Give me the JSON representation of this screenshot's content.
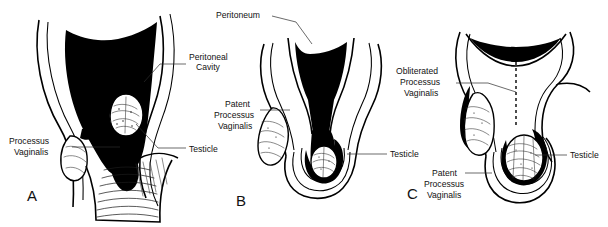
{
  "figure": {
    "background_color": "#ffffff",
    "ink_color": "#000000",
    "label_color": "#111111",
    "width": 608,
    "height": 227
  },
  "panels": [
    {
      "letter": "A",
      "labels": [
        {
          "id": "peritoneal-cavity",
          "text_lines": [
            "Peritoneal",
            "Cavity"
          ]
        },
        {
          "id": "processus-vaginalis",
          "text_lines": [
            "Processus",
            "Vaginalis"
          ]
        },
        {
          "id": "testicle",
          "text_lines": [
            "Testicle"
          ]
        }
      ]
    },
    {
      "letter": "B",
      "labels": [
        {
          "id": "peritoneum",
          "text_lines": [
            "Peritoneum"
          ]
        },
        {
          "id": "patent-processus-vaginalis",
          "text_lines": [
            "Patent",
            "Processus",
            "Vaginalis"
          ]
        },
        {
          "id": "testicle",
          "text_lines": [
            "Testicle"
          ]
        }
      ]
    },
    {
      "letter": "C",
      "labels": [
        {
          "id": "obliterated-processus-vaginalis",
          "text_lines": [
            "Obliterated",
            "Processus",
            "Vaginalis"
          ]
        },
        {
          "id": "testicle",
          "text_lines": [
            "Testicle"
          ]
        },
        {
          "id": "patent-processus-vaginalis",
          "text_lines": [
            "Patent",
            "Processus",
            "Vaginalis"
          ]
        }
      ]
    }
  ],
  "text": {
    "panel_a": {
      "letter": "A",
      "peritoneal_cavity_1": "Peritoneal",
      "peritoneal_cavity_2": "Cavity",
      "processus_vaginalis_1": "Processus",
      "processus_vaginalis_2": "Vaginalis",
      "testicle": "Testicle"
    },
    "panel_b": {
      "letter": "B",
      "peritoneum": "Peritoneum",
      "patent_1": "Patent",
      "patent_2": "Processus",
      "patent_3": "Vaginalis",
      "testicle": "Testicle"
    },
    "panel_c": {
      "letter": "C",
      "obliterated_1": "Obliterated",
      "obliterated_2": "Processus",
      "obliterated_3": "Vaginalis",
      "testicle": "Testicle",
      "patent_1": "Patent",
      "patent_2": "Processus",
      "patent_3": "Vaginalis"
    }
  }
}
